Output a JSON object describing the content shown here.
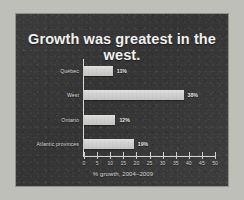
{
  "slide": {
    "title": "Growth was greatest in the west.",
    "background_color": "#3a3a3a",
    "frame_color": "#bfbfba",
    "bar_color": "#d3d3d1",
    "text_color": "#e6e6e4"
  },
  "chart_data": {
    "type": "bar",
    "orientation": "horizontal",
    "title": "Growth was greatest in the west.",
    "categories": [
      "Québec",
      "West",
      "Ontario",
      "Atlantic provinces"
    ],
    "values": [
      11,
      38,
      12,
      19
    ],
    "value_labels": [
      "11%",
      "38%",
      "12%",
      "19%"
    ],
    "xlabel": "% growth, 2004–2009",
    "ylabel": "",
    "xlim": [
      0,
      50
    ],
    "xticks": [
      0,
      5,
      10,
      15,
      20,
      25,
      30,
      35,
      40,
      45,
      50
    ],
    "xticklabels": [
      "0",
      "5",
      "10",
      "15",
      "20",
      "25",
      "30",
      "35",
      "40",
      "45",
      "50"
    ],
    "grid": false,
    "legend": null
  }
}
